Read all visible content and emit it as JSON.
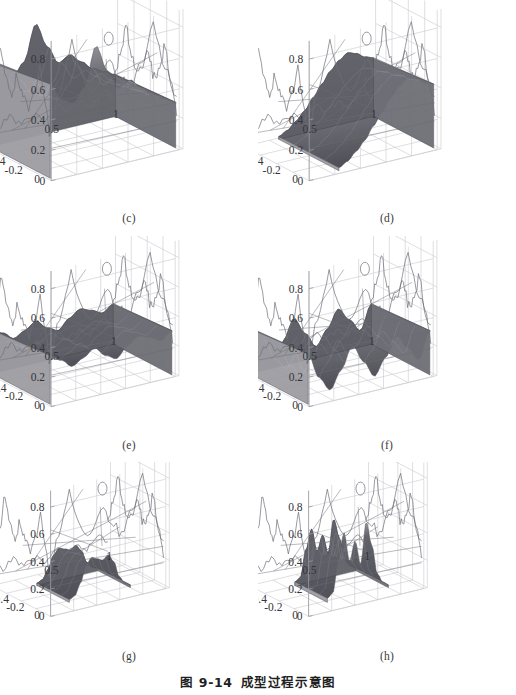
{
  "figure": {
    "caption_number": "图 9-14",
    "caption_title": "成型过程示意图",
    "background_color": "#ffffff",
    "ink_color": "#2a2a2a",
    "grid_color": "#c9c9cf",
    "wire_color": "#6e6e78",
    "surface_fill_light": "#b4b4b8",
    "surface_fill_dark": "#6a6a70"
  },
  "axes": {
    "z_ticks": [
      "0.8",
      "0.6",
      "0.4",
      "0.2",
      "0"
    ],
    "y_ticks": [
      "0",
      "-0.2",
      "-0.4",
      "-0.6"
    ],
    "x_ticks": [
      "0.5",
      "1"
    ],
    "z_range": [
      0,
      0.9
    ],
    "y_range": [
      -0.7,
      0.05
    ],
    "x_range": [
      0,
      1.15
    ]
  },
  "panels": [
    {
      "id": "c",
      "label": "(c)",
      "description": "Tall ridged surface with a sharp central peak near z=0.8, block of material filling most of the domain",
      "surface": {
        "type": "surface3d",
        "peak_height": 0.82,
        "base_height": 0.0,
        "coverage": "full",
        "profile": [
          0.62,
          0.5,
          0.46,
          0.55,
          0.8,
          0.62,
          0.48,
          0.52,
          0.45,
          0.38,
          0.34,
          0.3
        ],
        "fill_shade": "#8e8e94"
      }
    },
    {
      "id": "d",
      "label": "(d)",
      "description": "Wedge-shaped surface rising from the left-front toward the right-back corner, peak near z=0.5",
      "surface": {
        "type": "surface3d",
        "peak_height": 0.5,
        "base_height": 0.0,
        "coverage": "right-half",
        "profile": [
          0.02,
          0.05,
          0.1,
          0.16,
          0.24,
          0.32,
          0.4,
          0.46,
          0.5,
          0.48,
          0.44,
          0.42
        ],
        "fill_shade": "#7e7e86"
      }
    },
    {
      "id": "e",
      "label": "(e)",
      "description": "Flat plateau slab of roughly uniform height z=0.3 with shallow dips along the front face",
      "surface": {
        "type": "surface3d",
        "peak_height": 0.34,
        "base_height": 0.0,
        "coverage": "full-slab",
        "profile": [
          0.33,
          0.28,
          0.22,
          0.26,
          0.31,
          0.24,
          0.2,
          0.27,
          0.32,
          0.29,
          0.25,
          0.3
        ],
        "fill_shade": "#7a7a82"
      }
    },
    {
      "id": "f",
      "label": "(f)",
      "description": "Corrugated wavy slab with three broad troughs and crests, heights between z=0.05 and z=0.35",
      "surface": {
        "type": "surface3d",
        "peak_height": 0.36,
        "base_height": 0.0,
        "coverage": "full-slab",
        "profile": [
          0.34,
          0.16,
          0.06,
          0.18,
          0.33,
          0.2,
          0.08,
          0.19,
          0.32,
          0.22,
          0.12,
          0.3
        ],
        "fill_shade": "#74747c"
      }
    },
    {
      "id": "g",
      "label": "(g)",
      "description": "Small dark compact blob confined to the centre of the domain, maximum height about z=0.3",
      "surface": {
        "type": "surface3d",
        "peak_height": 0.3,
        "base_height": 0.0,
        "coverage": "centre-patch",
        "profile": [
          0.02,
          0.04,
          0.12,
          0.24,
          0.29,
          0.27,
          0.25,
          0.28,
          0.22,
          0.1,
          0.04,
          0.02
        ],
        "fill_shade": "#54545c"
      }
    },
    {
      "id": "h",
      "label": "(h)",
      "description": "Three sharp spiked peaks rising from a central patch, tallest peak about z=0.55",
      "surface": {
        "type": "surface3d",
        "peak_height": 0.55,
        "base_height": 0.0,
        "coverage": "centre-patch",
        "profile": [
          0.03,
          0.06,
          0.3,
          0.48,
          0.26,
          0.4,
          0.22,
          0.52,
          0.34,
          0.12,
          0.05,
          0.02
        ],
        "fill_shade": "#5e5e66"
      }
    }
  ],
  "chart_data": {
    "type": "surface",
    "title": "成型过程示意图",
    "subtitle": "图 9-14",
    "xlabel": "",
    "ylabel": "",
    "zlabel": "",
    "xlim": [
      0,
      1.15
    ],
    "ylim": [
      -0.7,
      0.05
    ],
    "zlim": [
      0,
      0.9
    ],
    "xticks": [
      0.5,
      1
    ],
    "yticks": [
      0,
      -0.2,
      -0.4,
      -0.6
    ],
    "zticks": [
      0,
      0.2,
      0.4,
      0.6,
      0.8
    ],
    "grid": true,
    "legend": "none",
    "projection": "3d-wireframe-with-shaded-surface",
    "series": [
      {
        "name": "(c)",
        "peak": 0.82,
        "mean_height": 0.47,
        "values": [
          0.62,
          0.5,
          0.46,
          0.55,
          0.8,
          0.62,
          0.48,
          0.52,
          0.45,
          0.38,
          0.34,
          0.3
        ]
      },
      {
        "name": "(d)",
        "peak": 0.5,
        "mean_height": 0.29,
        "values": [
          0.02,
          0.05,
          0.1,
          0.16,
          0.24,
          0.32,
          0.4,
          0.46,
          0.5,
          0.48,
          0.44,
          0.42
        ]
      },
      {
        "name": "(e)",
        "peak": 0.34,
        "mean_height": 0.27,
        "values": [
          0.33,
          0.28,
          0.22,
          0.26,
          0.31,
          0.24,
          0.2,
          0.27,
          0.32,
          0.29,
          0.25,
          0.3
        ]
      },
      {
        "name": "(f)",
        "peak": 0.36,
        "mean_height": 0.21,
        "values": [
          0.34,
          0.16,
          0.06,
          0.18,
          0.33,
          0.2,
          0.08,
          0.19,
          0.32,
          0.22,
          0.12,
          0.3
        ]
      },
      {
        "name": "(g)",
        "peak": 0.3,
        "mean_height": 0.16,
        "values": [
          0.02,
          0.04,
          0.12,
          0.24,
          0.29,
          0.27,
          0.25,
          0.28,
          0.22,
          0.1,
          0.04,
          0.02
        ]
      },
      {
        "name": "(h)",
        "peak": 0.55,
        "mean_height": 0.23,
        "values": [
          0.03,
          0.06,
          0.3,
          0.48,
          0.26,
          0.4,
          0.22,
          0.52,
          0.34,
          0.12,
          0.05,
          0.02
        ]
      }
    ],
    "envelope_wireframe": {
      "description": "Outer rough boundary mesh common to all six panels, representing the fixed die/boundary contour",
      "back_profile": [
        0.3,
        0.55,
        0.86,
        0.6,
        0.52,
        0.7,
        0.58,
        0.46,
        0.62,
        0.84,
        0.55,
        0.36
      ],
      "front_profile": [
        0.1,
        0.05,
        0.12,
        0.04,
        0.09,
        0.03,
        0.11,
        0.05,
        0.1,
        0.06,
        0.12,
        0.08
      ]
    }
  }
}
